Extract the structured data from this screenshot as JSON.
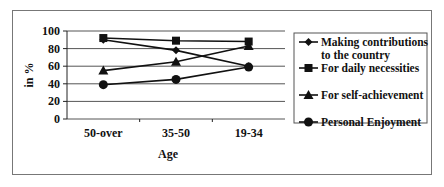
{
  "chart_data": {
    "type": "line",
    "title": "",
    "xlabel": "Age",
    "ylabel": "in %",
    "categories": [
      "50-over",
      "35-50",
      "19-34"
    ],
    "ylim": [
      0,
      100
    ],
    "yticks": [
      0,
      20,
      40,
      60,
      80,
      100
    ],
    "grid": true,
    "legend_position": "right",
    "series": [
      {
        "name": "Making contributions to the country",
        "legend_lines": [
          "Making contributions",
          "to the country"
        ],
        "marker": "diamond",
        "values": [
          90,
          78,
          60
        ]
      },
      {
        "name": "For daily necessities",
        "legend_lines": [
          "For daily necessities"
        ],
        "marker": "square",
        "values": [
          92,
          89,
          88
        ]
      },
      {
        "name": "For self-achievement",
        "legend_lines": [
          "For self-achievement"
        ],
        "marker": "triangle",
        "values": [
          55,
          65,
          83
        ]
      },
      {
        "name": "Personal Enjoyment",
        "legend_lines": [
          "Personal Enjoyment"
        ],
        "marker": "circle",
        "values": [
          39,
          45,
          59
        ]
      }
    ]
  },
  "colors": {
    "line": "#111111",
    "grid": "#555555",
    "frame": "#777777"
  }
}
